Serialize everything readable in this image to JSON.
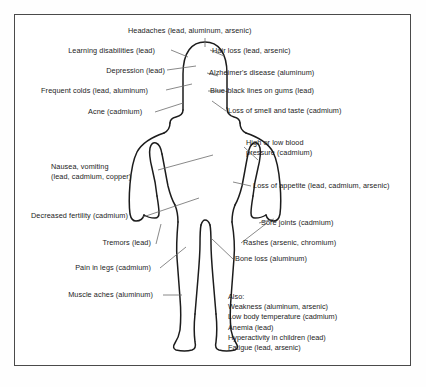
{
  "diagram": {
    "figure_name": "human-body-outline",
    "colors": {
      "border": "#4a4a4a",
      "outline": "#1c1c1c",
      "leader": "#6b6b6b",
      "text": "#1c1c1c",
      "background": "#ffffff"
    }
  },
  "labels_left": [
    {
      "text": "Learning disabilities (lead)",
      "x": 68,
      "y": 50
    },
    {
      "text": "Depression (lead)",
      "x": 106,
      "y": 70
    },
    {
      "text": "Frequent colds (lead, aluminum)",
      "x": 41,
      "y": 90
    },
    {
      "text": "Acne (cadmium)",
      "x": 88,
      "y": 111
    },
    {
      "text": "Decreased fertility (cadmium)",
      "x": 31,
      "y": 215
    },
    {
      "text": "Tremors (lead)",
      "x": 102,
      "y": 241
    },
    {
      "text": "Pain in legs (cadmium)",
      "x": 75,
      "y": 266
    },
    {
      "text": "Muscle aches (aluminum)",
      "x": 68,
      "y": 293
    }
  ],
  "labels_left_multiline": [
    {
      "line1": "Nausea, vomiting",
      "line2": "(lead, cadmium, copper)",
      "x": 51,
      "y": 168
    }
  ],
  "labels_top": [
    {
      "text": "Headaches (lead, aluminum, arsenic)",
      "x": 128,
      "y": 30
    }
  ],
  "labels_right": [
    {
      "text": "Hair loss (lead, arsenic)",
      "x": 212,
      "y": 50
    },
    {
      "text": "Alzheimer's disease (aluminum)",
      "x": 209,
      "y": 72
    },
    {
      "text": "Blue-black lines on gums (lead)",
      "x": 210,
      "y": 90
    },
    {
      "text": "Loss of smell and taste (cadmium)",
      "x": 228,
      "y": 110
    },
    {
      "text": "Loss of appetite (lead, cadmium, arsenic)",
      "x": 253,
      "y": 185
    },
    {
      "text": "Sore joints (cadmium)",
      "x": 261,
      "y": 222
    },
    {
      "text": "Rashes (arsenic, chromium)",
      "x": 243,
      "y": 242
    },
    {
      "text": "Bone loss (aluminum)",
      "x": 235,
      "y": 258
    }
  ],
  "labels_right_multiline": [
    {
      "line1": "High or low blood",
      "line2": "pressure (cadmium)",
      "x": 246,
      "y": 143
    }
  ],
  "also": {
    "heading": "Also:",
    "items": [
      "Weakness (aluminum, arsenic)",
      "Low body temperature (cadmium)",
      "Anemia (lead)",
      "Hyperactivity in children (lead)",
      "Fatigue (lead, arsenic)"
    ]
  }
}
